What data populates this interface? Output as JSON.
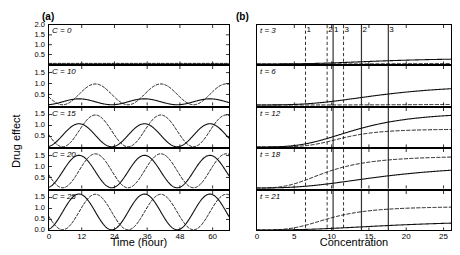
{
  "figure": {
    "panel_a_letter": "(a)",
    "panel_b_letter": "(b)",
    "ylabel": "Drug effect",
    "xlabel_a": "Time (hour)",
    "xlabel_b": "Concentration"
  },
  "chart_data": [
    {
      "type": "line",
      "panel": "(a)",
      "title": "",
      "xlabel": "Time (hour)",
      "ylabel": "Drug effect",
      "xlim": [
        0,
        66
      ],
      "xticks": [
        0,
        12,
        24,
        36,
        48,
        60
      ],
      "xtick_labels": [
        "0",
        "12",
        "24",
        "36",
        "48",
        "60"
      ],
      "grid": false,
      "legend": "none",
      "subplots": [
        {
          "label": "C = 0",
          "condition_variable": "C",
          "condition_value": 0,
          "ylim": [
            0,
            2.0
          ],
          "yticks": [
            0.5,
            1.0,
            1.5,
            2.0
          ],
          "ytick_labels": [
            "0.5",
            "1.0",
            "1.5",
            "2.0"
          ],
          "series": [
            {
              "name": "solid",
              "style": "solid",
              "baseline": 0.02,
              "amplitude": 0.0,
              "period": 24,
              "phase_hours": 12,
              "peak": 0.02
            },
            {
              "name": "dashed",
              "style": "dashed",
              "baseline": 0.05,
              "amplitude": 0.0,
              "period": 24,
              "phase_hours": 18,
              "peak": 0.05
            }
          ]
        },
        {
          "label": "C = 10",
          "condition_variable": "C",
          "condition_value": 10,
          "ylim": [
            0,
            1.8
          ],
          "yticks": [
            0.5,
            1.0,
            1.5
          ],
          "ytick_labels": [
            "0.5",
            "1.0",
            "1.5"
          ],
          "series": [
            {
              "name": "solid",
              "style": "solid",
              "baseline": 0.03,
              "amplitude": 0.27,
              "period": 24,
              "phase_hours": 11,
              "peak": 0.3
            },
            {
              "name": "dashed",
              "style": "dashed",
              "baseline": 0.03,
              "amplitude": 0.95,
              "period": 24,
              "phase_hours": 17,
              "peak": 0.98
            }
          ]
        },
        {
          "label": "C = 15",
          "condition_variable": "C",
          "condition_value": 15,
          "ylim": [
            0,
            1.8
          ],
          "yticks": [
            0.5,
            1.0,
            1.5
          ],
          "ytick_labels": [
            "0.5",
            "1.0",
            "1.5"
          ],
          "series": [
            {
              "name": "solid",
              "style": "solid",
              "baseline": 0.03,
              "amplitude": 1.05,
              "period": 24,
              "phase_hours": 11,
              "peak": 1.08
            },
            {
              "name": "dashed",
              "style": "dashed",
              "baseline": 0.03,
              "amplitude": 1.45,
              "period": 24,
              "phase_hours": 17,
              "peak": 1.48
            }
          ]
        },
        {
          "label": "C = 20",
          "condition_variable": "C",
          "condition_value": 20,
          "ylim": [
            0,
            1.8
          ],
          "yticks": [
            0.5,
            1.0,
            1.5
          ],
          "ytick_labels": [
            "0.5",
            "1.0",
            "1.5"
          ],
          "series": [
            {
              "name": "solid",
              "style": "solid",
              "baseline": 0.03,
              "amplitude": 1.48,
              "period": 24,
              "phase_hours": 11,
              "peak": 1.51
            },
            {
              "name": "dashed",
              "style": "dashed",
              "baseline": 0.03,
              "amplitude": 1.55,
              "period": 24,
              "phase_hours": 17,
              "peak": 1.58
            }
          ]
        },
        {
          "label": "C = 25",
          "condition_variable": "C",
          "condition_value": 25,
          "ylim": [
            0,
            1.8
          ],
          "yticks": [
            0.0,
            0.5,
            1.0,
            1.5
          ],
          "ytick_labels": [
            "0.0",
            "0.5",
            "1.0",
            "1.5"
          ],
          "series": [
            {
              "name": "solid",
              "style": "solid",
              "baseline": 0.03,
              "amplitude": 1.63,
              "period": 24,
              "phase_hours": 11,
              "peak": 1.66
            },
            {
              "name": "dashed",
              "style": "dashed",
              "baseline": 0.03,
              "amplitude": 1.62,
              "period": 24,
              "phase_hours": 17,
              "peak": 1.65
            }
          ]
        }
      ]
    },
    {
      "type": "line",
      "panel": "(b)",
      "title": "",
      "xlabel": "Concentration",
      "ylabel": "Drug effect",
      "xlim": [
        0,
        26
      ],
      "xticks": [
        0,
        5,
        10,
        15,
        20,
        25
      ],
      "xtick_labels": [
        "0",
        "5",
        "10",
        "15",
        "20",
        "25"
      ],
      "grid": false,
      "legend": "none",
      "marker_lines": [
        {
          "label": "1",
          "x": 6.5,
          "style": "dashed"
        },
        {
          "label": "2",
          "x": 9.4,
          "style": "dashed"
        },
        {
          "label": "1",
          "x": 10.2,
          "style": "solid"
        },
        {
          "label": "3",
          "x": 11.6,
          "style": "dashed"
        },
        {
          "label": "2",
          "x": 14.0,
          "style": "solid"
        },
        {
          "label": "3",
          "x": 17.6,
          "style": "solid"
        }
      ],
      "subplots": [
        {
          "label": "t = 3",
          "condition_variable": "t",
          "condition_value": 3,
          "ylim": [
            0,
            1.8
          ],
          "series": [
            {
              "name": "solid",
              "style": "solid",
              "emax": 0.28,
              "ec50": 17.0,
              "hill": 3.0
            },
            {
              "name": "dashed",
              "style": "dashed",
              "emax": 0.04,
              "ec50": 24.0,
              "hill": 4.0
            }
          ]
        },
        {
          "label": "t = 6",
          "condition_variable": "t",
          "condition_value": 6,
          "ylim": [
            0,
            1.8
          ],
          "series": [
            {
              "name": "solid",
              "style": "solid",
              "emax": 0.95,
              "ec50": 17.0,
              "hill": 3.0
            },
            {
              "name": "dashed",
              "style": "dashed",
              "emax": 0.04,
              "ec50": 24.0,
              "hill": 4.0
            }
          ]
        },
        {
          "label": "t = 12",
          "condition_variable": "t",
          "condition_value": 12,
          "ylim": [
            0,
            1.8
          ],
          "series": [
            {
              "name": "solid",
              "style": "solid",
              "emax": 1.62,
              "ec50": 13.5,
              "hill": 3.2
            },
            {
              "name": "dashed",
              "style": "dashed",
              "emax": 0.82,
              "ec50": 11.5,
              "hill": 4.5
            }
          ]
        },
        {
          "label": "t = 18",
          "condition_variable": "t",
          "condition_value": 18,
          "ylim": [
            0,
            1.8
          ],
          "series": [
            {
              "name": "solid",
              "style": "solid",
              "emax": 1.1,
              "ec50": 17.5,
              "hill": 2.6
            },
            {
              "name": "dashed",
              "style": "dashed",
              "emax": 1.48,
              "ec50": 9.5,
              "hill": 3.0
            }
          ]
        },
        {
          "label": "t = 21",
          "condition_variable": "t",
          "condition_value": 21,
          "ylim": [
            0,
            1.8
          ],
          "series": [
            {
              "name": "solid",
              "style": "solid",
              "emax": 0.45,
              "ec50": 19.0,
              "hill": 2.6
            },
            {
              "name": "dashed",
              "style": "dashed",
              "emax": 1.08,
              "ec50": 9.8,
              "hill": 3.4
            }
          ]
        }
      ]
    }
  ]
}
